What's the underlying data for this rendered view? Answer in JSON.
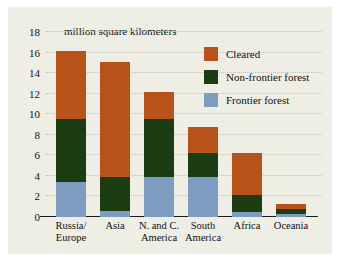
{
  "figure": {
    "background_color": "#eeeee4",
    "unit_label": "million square kilometers"
  },
  "chart_data": {
    "type": "bar",
    "stacked": true,
    "title": "",
    "subtitle": "",
    "xlabel": "",
    "ylabel": "million square kilometers",
    "ylim": [
      0,
      18
    ],
    "yticks": [
      0,
      2,
      4,
      6,
      8,
      10,
      12,
      14,
      16,
      18
    ],
    "ytick_labels": [
      "0",
      "2",
      "4",
      "6",
      "8",
      "10",
      "12",
      "14",
      "16",
      "18"
    ],
    "grid": true,
    "legend_position": "upper right",
    "categories": [
      "Russia/ Europe",
      "Asia",
      "N. and C. America",
      "South America",
      "Africa",
      "Oceania"
    ],
    "category_lines": [
      [
        "Russia/",
        "Europe"
      ],
      [
        "Asia",
        ""
      ],
      [
        "N. and C.",
        "America"
      ],
      [
        "South",
        "America"
      ],
      [
        "Africa",
        ""
      ],
      [
        "Oceania",
        ""
      ]
    ],
    "series": [
      {
        "name": "Frontier forest",
        "color": "#7e9cc0",
        "values": [
          3.4,
          0.6,
          3.9,
          3.9,
          0.5,
          0.3
        ]
      },
      {
        "name": "Non-frontier forest",
        "color": "#1c3d14",
        "values": [
          6.1,
          3.3,
          5.6,
          2.3,
          1.6,
          0.5
        ]
      },
      {
        "name": "Cleared",
        "color": "#b8521a",
        "values": [
          6.7,
          11.2,
          2.7,
          2.6,
          4.1,
          0.5
        ]
      }
    ],
    "totals": [
      16.2,
      15.1,
      12.2,
      8.8,
      6.2,
      1.3
    ],
    "legend_order": [
      "Cleared",
      "Non-frontier forest",
      "Frontier forest"
    ]
  }
}
